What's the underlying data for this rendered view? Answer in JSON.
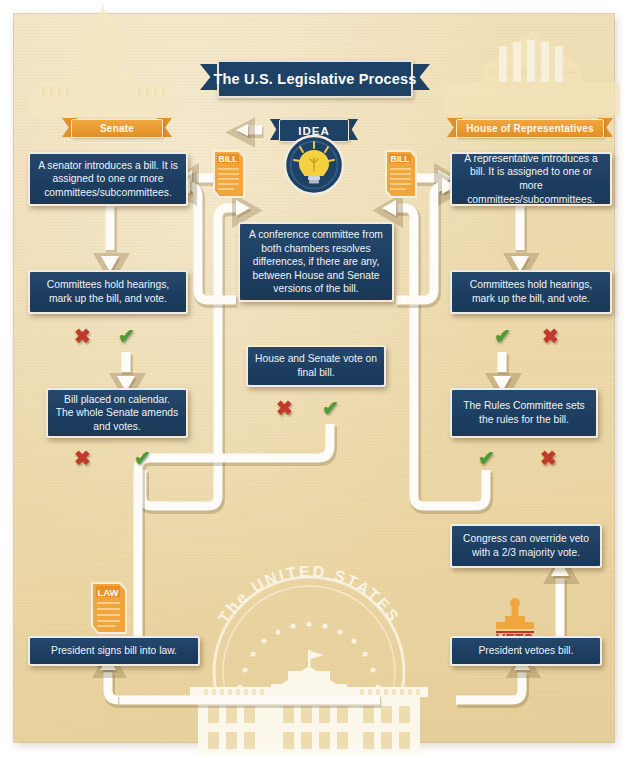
{
  "title": {
    "text": "The U.S. Legislative Process"
  },
  "chambers": {
    "senate_label": "Senate",
    "house_label": "House of Representatives"
  },
  "idea": {
    "label": "IDEA",
    "icon": "lightbulb-icon"
  },
  "bill_icons": {
    "left_label": "BILL",
    "right_label": "BILL"
  },
  "law_icon": {
    "label": "LAW"
  },
  "veto_icon": {
    "label": "VETO"
  },
  "watermarks": {
    "capitol": "us-capitol-silhouette",
    "supreme_court": "classical-building-silhouette",
    "white_house": "white-house-seal-silhouette",
    "seal_text": "The UNITED STATES"
  },
  "boxes": {
    "senate_intro": "A senator introduces a bill. It is assigned to one or more committees/subcommittees.",
    "house_intro": "A representative introduces a bill. It is assigned to one or more committees/subcommittees.",
    "senate_committee": "Committees hold hearings, mark up the bill, and vote.",
    "house_committee": "Committees hold hearings, mark up the bill, and vote.",
    "senate_calendar": "Bill placed on calendar. The whole Senate amends and votes.",
    "house_rules": "The Rules Committee sets the rules for the bill.",
    "conference": "A conference committee from both chambers resolves differences, if there are any, between House and Senate versions of the bill.",
    "final_vote": "House and Senate vote on final bill.",
    "override": "Congress can override veto with a 2/3 majority vote.",
    "signs": "President signs bill into law.",
    "vetoes": "President vetoes bill."
  },
  "marks": {
    "fail": "✖",
    "pass": "✔"
  },
  "colors": {
    "paper": "#eedcb0",
    "box_navy": "#1d3e61",
    "ribbon_orange": "#e0922c",
    "connector_white": "#fdfcf8",
    "fail_red": "#c0392b",
    "pass_green": "#4c9c3c"
  }
}
